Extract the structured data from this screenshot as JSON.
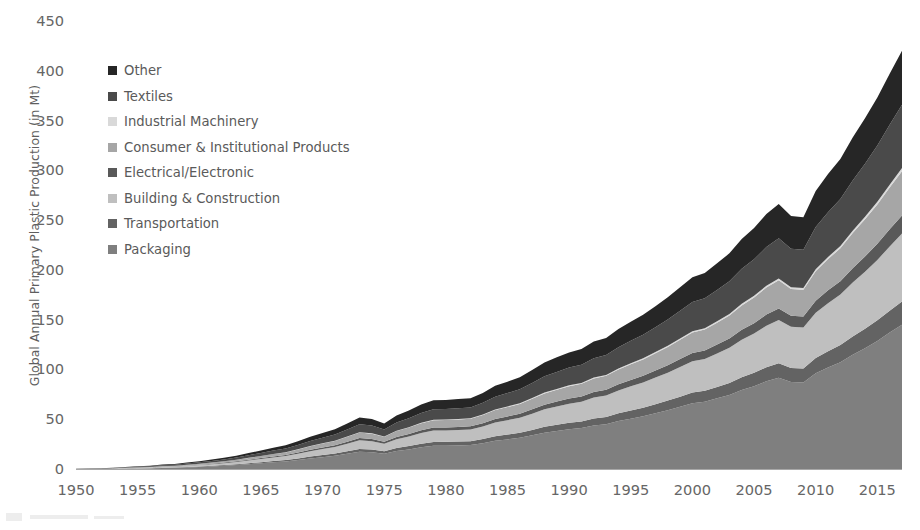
{
  "chart_data": {
    "type": "area",
    "title": "",
    "xlabel": "",
    "ylabel": "Global Annual Primary Plastic Production (in Mt)",
    "xlim": [
      1950,
      2017
    ],
    "ylim": [
      0,
      450
    ],
    "ytick_labels": [
      "450",
      "400",
      "350",
      "300",
      "250",
      "200",
      "150",
      "100",
      "50",
      "0"
    ],
    "ytick_values": [
      450,
      400,
      350,
      300,
      250,
      200,
      150,
      100,
      50,
      0
    ],
    "xtick_labels": [
      "1950",
      "1955",
      "1960",
      "1965",
      "1970",
      "1975",
      "1980",
      "1985",
      "1990",
      "1995",
      "2000",
      "2005",
      "2010",
      "2015"
    ],
    "xtick_values": [
      1950,
      1955,
      1960,
      1965,
      1970,
      1975,
      1980,
      1985,
      1990,
      1995,
      2000,
      2005,
      2010,
      2015
    ],
    "grid": false,
    "stacked": true,
    "legend_position": "upper-left",
    "legend_order_top_to_bottom": [
      "Other",
      "Textiles",
      "Industrial Machinery",
      "Consumer & Institutional Products",
      "Electrical/Electronic",
      "Building & Construction",
      "Transportation",
      "Packaging"
    ],
    "x": [
      1950,
      1951,
      1952,
      1953,
      1954,
      1955,
      1956,
      1957,
      1958,
      1959,
      1960,
      1961,
      1962,
      1963,
      1964,
      1965,
      1966,
      1967,
      1968,
      1969,
      1970,
      1971,
      1972,
      1973,
      1974,
      1975,
      1976,
      1977,
      1978,
      1979,
      1980,
      1981,
      1982,
      1983,
      1984,
      1985,
      1986,
      1987,
      1988,
      1989,
      1990,
      1991,
      1992,
      1993,
      1994,
      1995,
      1996,
      1997,
      1998,
      1999,
      2000,
      2001,
      2002,
      2003,
      2004,
      2005,
      2006,
      2007,
      2008,
      2009,
      2010,
      2011,
      2012,
      2013,
      2014,
      2015,
      2016,
      2017
    ],
    "series": [
      {
        "name": "Packaging",
        "color": "#7f7f7f",
        "values": [
          0.4,
          0.5,
          0.6,
          0.8,
          1.0,
          1.3,
          1.5,
          1.9,
          2.1,
          2.6,
          3.1,
          3.6,
          4.2,
          5.0,
          5.9,
          6.8,
          7.8,
          8.6,
          10.0,
          11.6,
          12.9,
          14.2,
          16.2,
          18.3,
          17.8,
          16.2,
          19.0,
          20.7,
          22.8,
          24.3,
          24.4,
          24.7,
          25.0,
          26.8,
          29.3,
          30.7,
          32.3,
          34.8,
          37.4,
          39.2,
          40.9,
          42.1,
          44.7,
          46.0,
          49.1,
          51.6,
          54.0,
          57.0,
          60.1,
          63.6,
          67.1,
          68.6,
          72.0,
          75.4,
          80.4,
          84.2,
          89.1,
          92.6,
          88.4,
          88.0,
          97.1,
          103.0,
          108.3,
          115.7,
          122.4,
          129.7,
          138.0,
          146.0
        ]
      },
      {
        "name": "Transportation",
        "color": "#636363",
        "values": [
          0.1,
          0.1,
          0.1,
          0.1,
          0.2,
          0.2,
          0.2,
          0.3,
          0.3,
          0.4,
          0.5,
          0.6,
          0.7,
          0.8,
          0.9,
          1.1,
          1.2,
          1.4,
          1.6,
          1.9,
          2.1,
          2.3,
          2.6,
          2.9,
          2.8,
          2.6,
          3.0,
          3.3,
          3.6,
          3.9,
          3.9,
          3.9,
          4.0,
          4.3,
          4.7,
          4.9,
          5.1,
          5.5,
          6.0,
          6.2,
          6.5,
          6.7,
          7.1,
          7.3,
          7.8,
          8.2,
          8.6,
          9.1,
          9.6,
          10.1,
          10.7,
          10.9,
          11.4,
          12.0,
          12.8,
          13.4,
          14.2,
          14.7,
          14.0,
          14.0,
          15.4,
          16.4,
          17.2,
          18.4,
          19.5,
          20.6,
          21.9,
          23.2
        ]
      },
      {
        "name": "Building & Construction",
        "color": "#bfbfbf",
        "values": [
          0.2,
          0.2,
          0.3,
          0.4,
          0.5,
          0.6,
          0.7,
          0.9,
          1.0,
          1.2,
          1.4,
          1.7,
          2.0,
          2.3,
          2.8,
          3.2,
          3.6,
          4.0,
          4.7,
          5.4,
          6.0,
          6.6,
          7.6,
          8.6,
          8.3,
          7.6,
          8.9,
          9.7,
          10.7,
          11.4,
          11.4,
          11.6,
          11.7,
          12.6,
          13.7,
          14.4,
          15.1,
          16.3,
          17.5,
          18.4,
          19.2,
          19.7,
          20.9,
          21.5,
          23.0,
          24.2,
          25.3,
          26.7,
          28.1,
          29.8,
          31.4,
          32.1,
          33.7,
          35.3,
          37.6,
          39.4,
          41.7,
          43.4,
          41.4,
          41.2,
          45.5,
          48.2,
          50.7,
          54.2,
          57.3,
          60.7,
          64.6,
          68.3
        ]
      },
      {
        "name": "Electrical/Electronic",
        "color": "#595959",
        "values": [
          0.05,
          0.06,
          0.07,
          0.1,
          0.12,
          0.16,
          0.19,
          0.23,
          0.26,
          0.32,
          0.38,
          0.45,
          0.52,
          0.62,
          0.73,
          0.85,
          0.97,
          1.07,
          1.24,
          1.44,
          1.6,
          1.77,
          2.02,
          2.28,
          2.21,
          2.02,
          2.37,
          2.58,
          2.84,
          3.03,
          3.04,
          3.08,
          3.12,
          3.34,
          3.65,
          3.83,
          4.03,
          4.34,
          4.66,
          4.89,
          5.1,
          5.25,
          5.57,
          5.74,
          6.12,
          6.43,
          6.73,
          7.11,
          7.49,
          7.93,
          8.37,
          8.55,
          8.98,
          9.4,
          10.02,
          10.5,
          11.11,
          11.55,
          11.02,
          10.97,
          12.11,
          12.84,
          13.5,
          14.42,
          15.26,
          16.17,
          17.2,
          18.2
        ]
      },
      {
        "name": "Consumer & Institutional Products",
        "color": "#a6a6a6",
        "values": [
          0.12,
          0.15,
          0.18,
          0.24,
          0.3,
          0.39,
          0.46,
          0.57,
          0.64,
          0.79,
          0.94,
          1.1,
          1.28,
          1.52,
          1.8,
          2.07,
          2.38,
          2.62,
          3.05,
          3.53,
          3.93,
          4.33,
          4.94,
          5.58,
          5.42,
          4.94,
          5.79,
          6.31,
          6.95,
          7.41,
          7.44,
          7.53,
          7.62,
          8.17,
          8.93,
          9.36,
          9.85,
          10.61,
          11.4,
          11.95,
          12.47,
          12.84,
          13.63,
          14.02,
          14.97,
          15.73,
          16.46,
          17.38,
          18.32,
          19.39,
          20.46,
          20.91,
          21.95,
          22.99,
          24.51,
          25.67,
          27.16,
          28.23,
          26.95,
          26.83,
          29.6,
          31.4,
          33.01,
          35.27,
          37.32,
          39.54,
          42.07,
          44.5
        ]
      },
      {
        "name": "Industrial Machinery",
        "color": "#d9d9d9",
        "values": [
          0.01,
          0.01,
          0.01,
          0.02,
          0.02,
          0.03,
          0.03,
          0.04,
          0.04,
          0.05,
          0.06,
          0.07,
          0.09,
          0.1,
          0.12,
          0.14,
          0.16,
          0.18,
          0.21,
          0.24,
          0.27,
          0.29,
          0.34,
          0.38,
          0.37,
          0.34,
          0.39,
          0.43,
          0.47,
          0.5,
          0.5,
          0.51,
          0.52,
          0.56,
          0.61,
          0.64,
          0.67,
          0.72,
          0.78,
          0.81,
          0.85,
          0.87,
          0.93,
          0.95,
          1.02,
          1.07,
          1.12,
          1.18,
          1.25,
          1.32,
          1.39,
          1.42,
          1.49,
          1.56,
          1.67,
          1.75,
          1.85,
          1.92,
          1.83,
          1.82,
          2.01,
          2.13,
          2.25,
          2.4,
          2.54,
          2.69,
          2.86,
          3.03
        ]
      },
      {
        "name": "Textiles",
        "color": "#4a4a4a",
        "values": [
          0.17,
          0.21,
          0.26,
          0.34,
          0.43,
          0.55,
          0.66,
          0.81,
          0.92,
          1.13,
          1.34,
          1.58,
          1.83,
          2.18,
          2.58,
          2.97,
          3.4,
          3.75,
          4.36,
          5.05,
          5.62,
          6.19,
          7.07,
          7.98,
          7.75,
          7.07,
          8.28,
          9.03,
          9.94,
          10.6,
          10.64,
          10.77,
          10.9,
          11.69,
          12.78,
          13.39,
          14.09,
          15.18,
          16.31,
          17.1,
          17.84,
          18.36,
          19.5,
          20.06,
          21.41,
          22.5,
          23.55,
          24.86,
          26.21,
          27.74,
          29.27,
          29.92,
          31.4,
          32.89,
          35.06,
          36.72,
          38.86,
          40.38,
          38.56,
          38.38,
          42.35,
          44.92,
          47.22,
          50.45,
          53.38,
          56.56,
          60.18,
          63.6
        ]
      },
      {
        "name": "Other",
        "color": "#262626",
        "values": [
          0.15,
          0.18,
          0.22,
          0.29,
          0.37,
          0.47,
          0.56,
          0.69,
          0.79,
          0.96,
          1.15,
          1.35,
          1.56,
          1.86,
          2.2,
          2.54,
          2.9,
          3.2,
          3.72,
          4.31,
          4.8,
          5.28,
          6.03,
          6.81,
          6.61,
          6.03,
          7.06,
          7.7,
          8.48,
          9.04,
          9.08,
          9.19,
          9.3,
          9.97,
          10.9,
          11.42,
          12.02,
          12.95,
          13.91,
          14.59,
          15.22,
          15.66,
          16.63,
          17.11,
          18.26,
          19.19,
          20.09,
          21.2,
          22.36,
          23.66,
          24.97,
          25.52,
          26.79,
          28.06,
          29.91,
          31.32,
          33.14,
          34.44,
          32.89,
          32.74,
          36.12,
          38.31,
          40.28,
          43.04,
          45.54,
          48.25,
          51.33,
          54.25
        ]
      }
    ]
  },
  "legend": {
    "items": [
      {
        "label": "Other",
        "color": "#262626"
      },
      {
        "label": "Textiles",
        "color": "#4a4a4a"
      },
      {
        "label": "Industrial Machinery",
        "color": "#d9d9d9"
      },
      {
        "label": "Consumer & Institutional Products",
        "color": "#a6a6a6"
      },
      {
        "label": "Electrical/Electronic",
        "color": "#595959"
      },
      {
        "label": "Building & Construction",
        "color": "#bfbfbf"
      },
      {
        "label": "Transportation",
        "color": "#636363"
      },
      {
        "label": "Packaging",
        "color": "#7f7f7f"
      }
    ]
  }
}
